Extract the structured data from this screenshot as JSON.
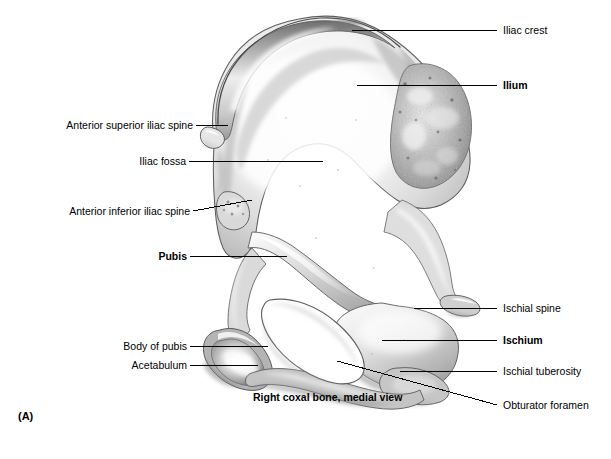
{
  "figure": {
    "panel_letter": "(A)",
    "caption": "Right coxal bone, medial view",
    "background_color": "#ffffff",
    "line_color": "#000000",
    "width": 611,
    "height": 459
  },
  "labels": {
    "iliac_crest": "Iliac crest",
    "ilium": "Ilium",
    "anterior_superior_iliac_spine": "Anterior superior iliac spine",
    "iliac_fossa": "Iliac fossa",
    "anterior_inferior_iliac_spine": "Anterior inferior iliac spine",
    "pubis": "Pubis",
    "body_of_pubis": "Body of pubis",
    "acetabulum": "Acetabulum",
    "ischial_spine": "Ischial spine",
    "ischium": "Ischium",
    "ischial_tuberosity": "Ischial tuberosity",
    "obturator_foramen": "Obturator foramen"
  },
  "label_placement": [
    {
      "key": "iliac_crest",
      "side": "right",
      "bold": false,
      "text_x": 503,
      "text_y": 24,
      "line": [
        [
          497,
          30
        ],
        [
          352,
          30
        ]
      ]
    },
    {
      "key": "ilium",
      "side": "right",
      "bold": true,
      "text_x": 503,
      "text_y": 79,
      "line": [
        [
          497,
          85
        ],
        [
          357,
          85
        ]
      ]
    },
    {
      "key": "anterior_superior_iliac_spine",
      "side": "left",
      "bold": false,
      "text_x": 41,
      "text_y": 119,
      "line": [
        [
          196,
          125
        ],
        [
          228,
          125
        ]
      ]
    },
    {
      "key": "iliac_fossa",
      "side": "left",
      "bold": false,
      "text_x": 122,
      "text_y": 155,
      "line": [
        [
          189,
          161
        ],
        [
          323,
          161
        ]
      ]
    },
    {
      "key": "anterior_inferior_iliac_spine",
      "side": "left",
      "bold": false,
      "text_x": 55,
      "text_y": 205,
      "line": [
        [
          193,
          211
        ],
        [
          252,
          200
        ]
      ]
    },
    {
      "key": "pubis",
      "side": "left",
      "bold": true,
      "text_x": 145,
      "text_y": 250,
      "line": [
        [
          190,
          256
        ],
        [
          287,
          256
        ]
      ]
    },
    {
      "key": "body_of_pubis",
      "side": "left",
      "bold": false,
      "text_x": 110,
      "text_y": 340,
      "line": [
        [
          190,
          346
        ],
        [
          268,
          346
        ]
      ]
    },
    {
      "key": "acetabulum",
      "side": "left",
      "bold": false,
      "text_x": 117,
      "text_y": 359,
      "line": [
        [
          190,
          365
        ],
        [
          258,
          365
        ]
      ]
    },
    {
      "key": "ischial_spine",
      "side": "right",
      "bold": false,
      "text_x": 503,
      "text_y": 302,
      "line": [
        [
          497,
          308
        ],
        [
          414,
          308
        ]
      ]
    },
    {
      "key": "ischium",
      "side": "right",
      "bold": true,
      "text_x": 503,
      "text_y": 334,
      "line": [
        [
          497,
          340
        ],
        [
          382,
          340
        ]
      ]
    },
    {
      "key": "ischial_tuberosity",
      "side": "right",
      "bold": false,
      "text_x": 503,
      "text_y": 365,
      "line": [
        [
          497,
          371
        ],
        [
          400,
          371
        ]
      ]
    },
    {
      "key": "obturator_foramen",
      "side": "right",
      "bold": false,
      "text_x": 503,
      "text_y": 399,
      "line": [
        [
          497,
          405
        ],
        [
          337,
          361
        ]
      ]
    }
  ],
  "caption_position": {
    "x": 253,
    "y": 391
  },
  "panel_letter_position": {
    "x": 18,
    "y": 410
  },
  "bone_structures": [
    "ilium",
    "iliac crest",
    "iliac fossa",
    "auricular surface",
    "anterior superior iliac spine",
    "anterior inferior iliac spine",
    "greater sciatic notch",
    "ischial spine",
    "ischium",
    "ischial tuberosity",
    "pubis",
    "body of pubis",
    "obturator foramen"
  ]
}
